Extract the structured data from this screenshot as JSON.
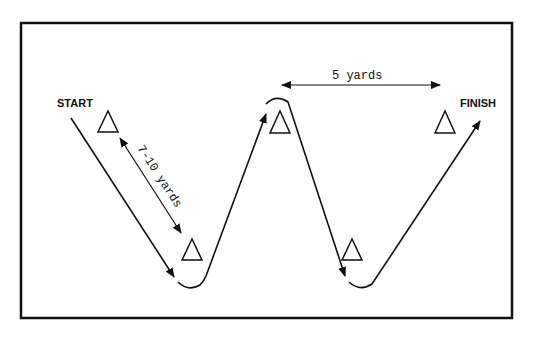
{
  "diagram": {
    "labels": {
      "start": "START",
      "finish": "FINISH",
      "horizontal_distance": "5 yards",
      "diagonal_distance": "7-10 yards"
    },
    "cones": [
      {
        "id": "cone-1",
        "x": 108,
        "y": 121
      },
      {
        "id": "cone-2",
        "x": 192,
        "y": 250
      },
      {
        "id": "cone-3",
        "x": 280,
        "y": 122
      },
      {
        "id": "cone-4",
        "x": 352,
        "y": 250
      },
      {
        "id": "cone-5",
        "x": 445,
        "y": 122
      }
    ],
    "colors": {
      "line": "#111111",
      "background": "#ffffff"
    }
  }
}
